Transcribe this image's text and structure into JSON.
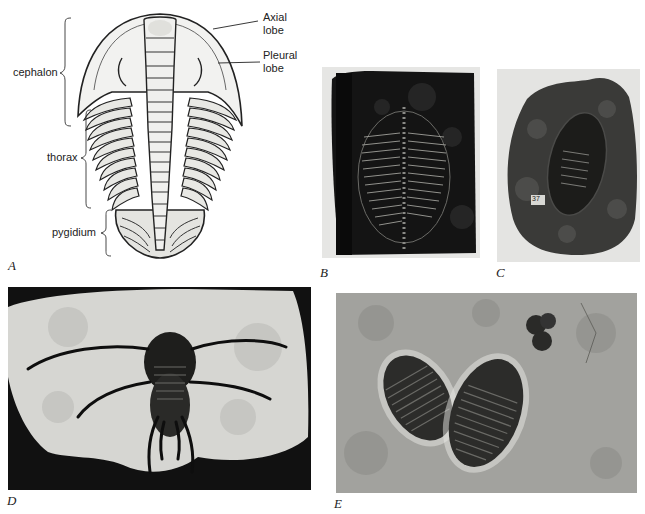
{
  "figure": {
    "panels": [
      {
        "id": "A",
        "label": "A",
        "kind": "line-drawing",
        "subject": "trilobite dorsal anatomy"
      },
      {
        "id": "B",
        "label": "B",
        "kind": "photo",
        "subject": "dark slate trilobite fossil"
      },
      {
        "id": "C",
        "label": "C",
        "kind": "photo",
        "subject": "enrolled trilobite in nodule",
        "specimen_tag": "37"
      },
      {
        "id": "D",
        "label": "D",
        "kind": "photo",
        "subject": "spiny trilobite on pale rock"
      },
      {
        "id": "E",
        "label": "E",
        "kind": "photo",
        "subject": "two trilobites on grey matrix"
      }
    ],
    "anatomy_labels": {
      "cephalon": "cephalon",
      "thorax": "thorax",
      "pygidium": "pygidium",
      "axial_lobe_line1": "Axial",
      "axial_lobe_line2": "lobe",
      "pleural_lobe_line1": "Pleural",
      "pleural_lobe_line2": "lobe"
    },
    "colors": {
      "background": "#ffffff",
      "ink": "#222222",
      "slate": "#1a1a1a",
      "nodule": "#3a3a3a",
      "pale_rock": "#d8d8d4",
      "matrix": "#9a9a96"
    }
  }
}
